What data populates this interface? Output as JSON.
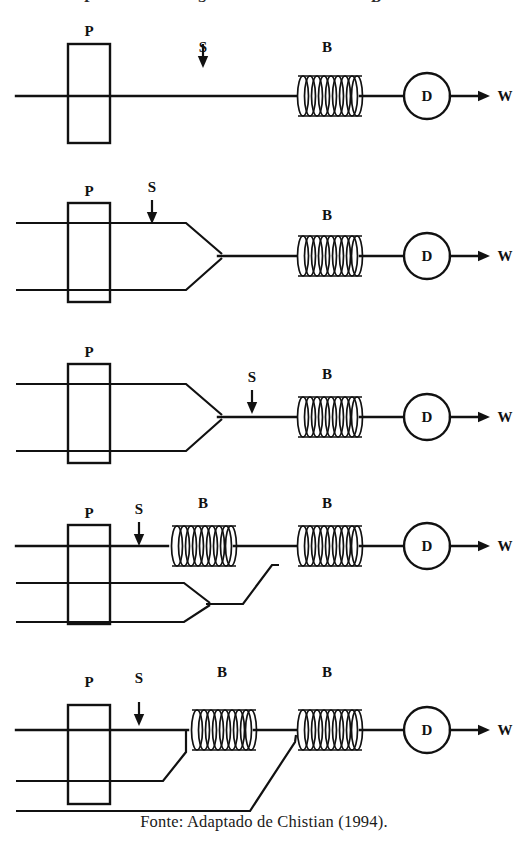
{
  "figure": {
    "caption": "Fonte: Adaptado de Chistian (1994).",
    "partial_top_labels": [
      "P",
      "S",
      "B"
    ],
    "labels": {
      "pump": "P",
      "sample": "S",
      "coil": "B",
      "detector": "D",
      "waste": "W"
    },
    "colors": {
      "ink": "#111111",
      "background": "#ffffff"
    },
    "rows": [
      {
        "id": "config-1",
        "name": "single-line-manifold",
        "channels": 1,
        "coils": 1,
        "labels": [
          "P",
          "S",
          "B",
          "D",
          "W"
        ]
      },
      {
        "id": "config-2",
        "name": "two-line-confluence-before-coil",
        "channels": 2,
        "coils": 1,
        "labels": [
          "P",
          "S",
          "B",
          "D",
          "W"
        ]
      },
      {
        "id": "config-3",
        "name": "two-line-confluence-injection-after-merge",
        "channels": 2,
        "coils": 1,
        "labels": [
          "P",
          "S",
          "B",
          "D",
          "W"
        ]
      },
      {
        "id": "config-4",
        "name": "three-line-two-coils",
        "channels": 3,
        "coils": 2,
        "labels": [
          "P",
          "S",
          "B",
          "B",
          "D",
          "W"
        ]
      },
      {
        "id": "config-5",
        "name": "three-line-sequential-confluence-two-coils",
        "channels": 3,
        "coils": 2,
        "labels": [
          "P",
          "S",
          "B",
          "B",
          "D",
          "W"
        ]
      }
    ]
  }
}
